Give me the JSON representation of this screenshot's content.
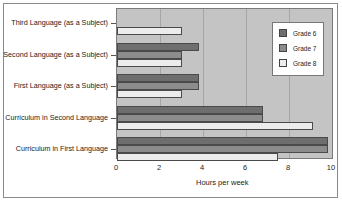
{
  "chart_data": {
    "type": "bar",
    "orientation": "horizontal",
    "title": "",
    "xlabel": "Hours per week",
    "ylabel": "",
    "xlim": [
      0,
      10
    ],
    "xticks": [
      0,
      2,
      4,
      6,
      8,
      10
    ],
    "grid": {
      "x": true,
      "y": false
    },
    "legend_position": "upper right, inside plot",
    "categories": [
      "Third Language (as a Subject)",
      "Second Language (as a Subject)",
      "First Language (as a Subject)",
      "Curriculum in Second Language",
      "Curriculum in First Language"
    ],
    "series": [
      {
        "name": "Grade 6",
        "color": "#6e6e6e",
        "values": [
          0,
          3.8,
          3.8,
          6.8,
          9.8
        ]
      },
      {
        "name": "Grade 7",
        "color": "#8c8c8c",
        "values": [
          0,
          3.0,
          3.8,
          6.8,
          9.8
        ]
      },
      {
        "name": "Grade 8",
        "color": "#ececec",
        "values": [
          3.0,
          3.0,
          3.0,
          9.1,
          7.5
        ]
      }
    ]
  },
  "colors": {
    "plot_background": "#c4c4c4",
    "gridline": "#a6a6a6",
    "frame_border": "#8a8a8a"
  }
}
